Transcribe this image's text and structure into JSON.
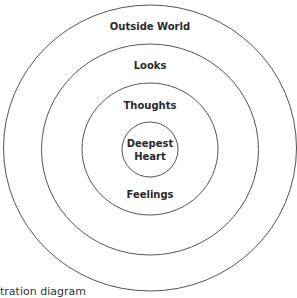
{
  "diagram": {
    "type": "concentric-circles",
    "stroke_color": "#555555",
    "text_color": "#2a2a2a",
    "rings": [
      {
        "label": "Outside World",
        "cx": 150,
        "cy": 148,
        "rx": 146.5,
        "ry": 143
      },
      {
        "label": "Looks",
        "cx": 150,
        "cy": 149.5,
        "rx": 108.5,
        "ry": 105.5
      },
      {
        "label": "Thoughts",
        "cx": 150,
        "cy": 149,
        "rx": 68,
        "ry": 66
      },
      {
        "label": "Deepest Heart",
        "cx": 150,
        "cy": 149.5,
        "rx": 28,
        "ry": 27.5
      }
    ],
    "labels": {
      "outside_world": "Outside World",
      "looks": "Looks",
      "thoughts": "Thoughts",
      "deepest": "Deepest",
      "heart": "Heart",
      "feelings": "Feelings"
    },
    "caption_partial": "tration diagram"
  }
}
